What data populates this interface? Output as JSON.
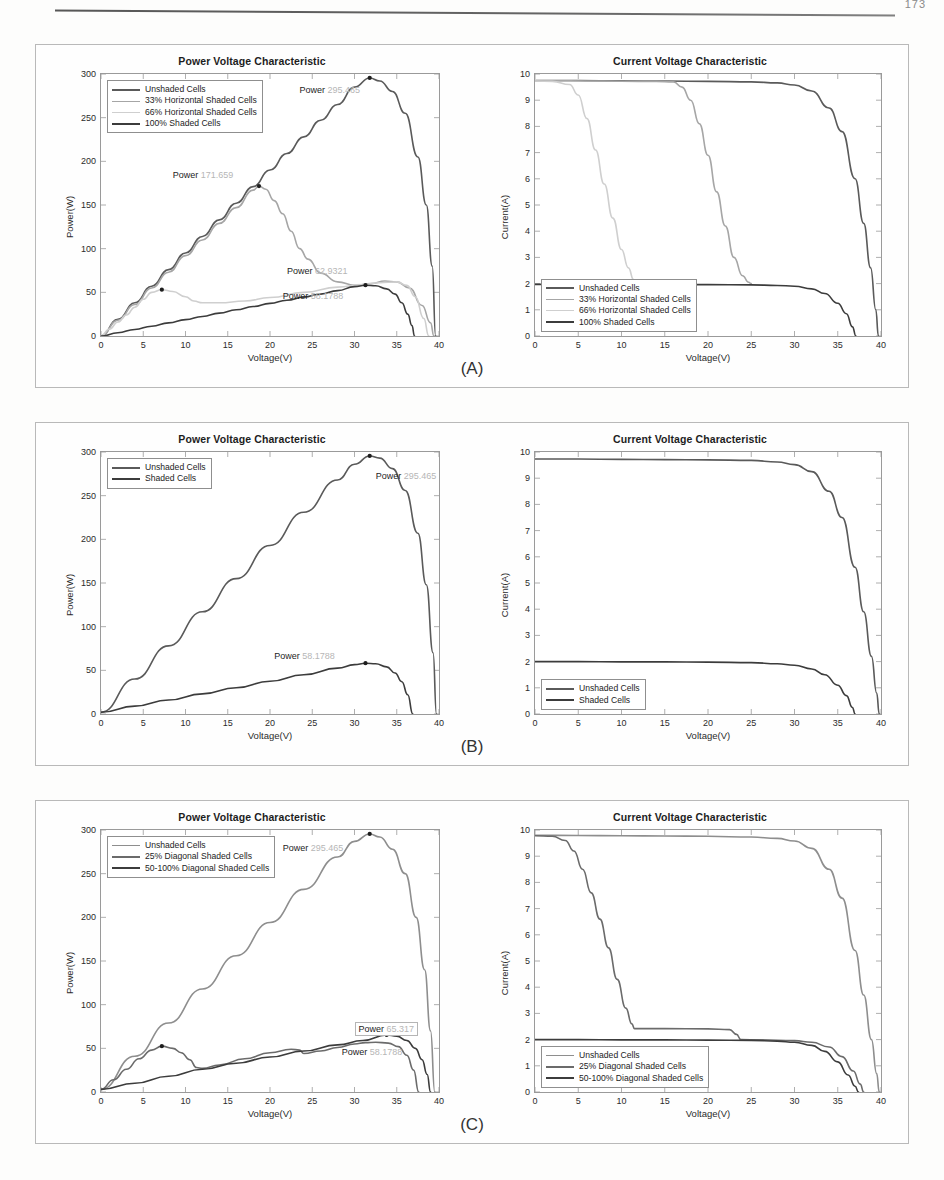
{
  "page": {
    "number": "173",
    "panel_labels": [
      "(A)",
      "(B)",
      "(C)"
    ]
  },
  "axes": {
    "power_title": "Power Voltage Characteristic",
    "current_title": "Current Voltage Characteristic",
    "xlabel": "Voltage(V)",
    "ylabel_power": "Power(W)",
    "ylabel_current": "Current(A)",
    "xticks": [
      "0",
      "5",
      "10",
      "15",
      "20",
      "25",
      "30",
      "35",
      "40"
    ],
    "yticks_power": [
      "0",
      "50",
      "100",
      "150",
      "200",
      "250",
      "300"
    ],
    "yticks_current": [
      "0",
      "1",
      "2",
      "3",
      "4",
      "5",
      "6",
      "7",
      "8",
      "9",
      "10"
    ]
  },
  "colors": {
    "unshaded": "#5a5a5a",
    "shade_a": "#9a9a9a",
    "shade_b": "#c2c2c2",
    "shade_c": "#3c3c3c",
    "axis": "#9a9a9a",
    "text": "#1d1d1d",
    "faded_value": "#b6b6b6"
  },
  "panels": [
    {
      "id": "A",
      "label": "(A)",
      "legend": [
        {
          "label": "Unshaded Cells",
          "color": "#5a5a5a",
          "width": 2.2
        },
        {
          "label": "33% Horizontal Shaded Cells",
          "color": "#a6a6a6",
          "width": 1.6
        },
        {
          "label": "66% Horizontal Shaded Cells",
          "color": "#cfcfcf",
          "width": 1.4
        },
        {
          "label": "100% Shaded Cells",
          "color": "#3c3c3c",
          "width": 2.4
        }
      ],
      "annotations": [
        {
          "prefix": "Power ",
          "value": "295.465"
        },
        {
          "prefix": "Power ",
          "value": "171.659"
        },
        {
          "prefix": "Power ",
          "value": "62.9321"
        },
        {
          "prefix": "Power ",
          "value": "58.1788"
        }
      ]
    },
    {
      "id": "B",
      "label": "(B)",
      "legend": [
        {
          "label": "Unshaded Cells",
          "color": "#5a5a5a",
          "width": 2.2
        },
        {
          "label": "Shaded Cells",
          "color": "#3c3c3c",
          "width": 2.4
        }
      ],
      "annotations": [
        {
          "prefix": "Power ",
          "value": "295.465"
        },
        {
          "prefix": "Power ",
          "value": "58.1788"
        }
      ]
    },
    {
      "id": "C",
      "label": "(C)",
      "legend": [
        {
          "label": "Unshaded Cells",
          "color": "#8e8e8e",
          "width": 1.8
        },
        {
          "label": "25% Diagonal Shaded Cells",
          "color": "#6b6b6b",
          "width": 2.0
        },
        {
          "label": "50-100% Diagonal Shaded Cells",
          "color": "#3c3c3c",
          "width": 2.4
        }
      ],
      "annotations": [
        {
          "prefix": "Power ",
          "value": "295.465"
        },
        {
          "prefix": "Power ",
          "value": "65.317"
        },
        {
          "prefix": "Power ",
          "value": "58.1788"
        }
      ]
    }
  ],
  "chart_data": [
    {
      "id": "A-power",
      "type": "line",
      "title": "Power Voltage Characteristic",
      "xlabel": "Voltage(V)",
      "ylabel": "Power(W)",
      "xlim": [
        0,
        40
      ],
      "ylim": [
        0,
        300
      ],
      "grid": false,
      "legend_position": "top-left",
      "series": [
        {
          "name": "Unshaded Cells",
          "color": "#5a5a5a",
          "peak": {
            "v": 31.8,
            "p": 295.465
          },
          "x": [
            0,
            2,
            4,
            6,
            8,
            10,
            12,
            14,
            16,
            18,
            20,
            22,
            24,
            26,
            28,
            30,
            31.8,
            33,
            34.5,
            36,
            37.5,
            38.5,
            39.2,
            39.6
          ],
          "y": [
            0,
            19,
            38,
            57,
            76,
            95,
            114,
            133,
            152,
            171,
            190,
            209,
            228,
            247,
            265,
            285,
            295.465,
            292,
            280,
            255,
            205,
            150,
            80,
            0
          ]
        },
        {
          "name": "33% Horizontal Shaded Cells",
          "color": "#a6a6a6",
          "peak": {
            "v": 18.7,
            "p": 171.659
          },
          "x": [
            0,
            2,
            4,
            6,
            8,
            10,
            12,
            14,
            16,
            18,
            18.7,
            19.5,
            20.5,
            21.5,
            22.5,
            23.5,
            24.5,
            26,
            28,
            30,
            32,
            33.6,
            35,
            36.5,
            38,
            39,
            39.4
          ],
          "y": [
            0,
            18,
            36,
            55,
            73,
            92,
            110,
            129,
            147,
            167,
            171.659,
            168,
            155,
            140,
            120,
            100,
            88,
            72,
            62,
            58,
            60,
            62.9321,
            62,
            55,
            35,
            15,
            0
          ]
        },
        {
          "name": "66% Horizontal Shaded Cells",
          "color": "#cfcfcf",
          "peak": {
            "v": 7.2,
            "p": 53.0
          },
          "x": [
            0,
            1,
            2,
            3,
            4,
            5,
            6,
            7.2,
            8.5,
            10,
            11,
            12,
            14,
            17,
            20,
            24,
            28,
            31,
            33,
            35,
            36.2,
            37.2,
            38.2,
            38.8
          ],
          "y": [
            0,
            8,
            16,
            24,
            33,
            42,
            50,
            53.0,
            51,
            45,
            40,
            38,
            38,
            40,
            44,
            50,
            56,
            59,
            61,
            62,
            58,
            45,
            20,
            0
          ]
        },
        {
          "name": "100% Shaded Cells",
          "color": "#3c3c3c",
          "peak": {
            "v": 31.3,
            "p": 58.1788
          },
          "x": [
            0,
            2,
            4,
            6,
            8,
            10,
            12,
            14,
            16,
            18,
            20,
            22,
            24,
            26,
            28,
            30,
            31.3,
            32.5,
            33.8,
            34.8,
            35.6,
            36.3,
            36.8,
            37.1
          ],
          "y": [
            0,
            3.7,
            7.5,
            11.2,
            15,
            18.7,
            22.4,
            26.2,
            30,
            33.7,
            37.4,
            41,
            44.5,
            48,
            52,
            56.5,
            58.1788,
            57.5,
            54,
            48,
            38,
            25,
            12,
            0
          ]
        }
      ]
    },
    {
      "id": "A-current",
      "type": "line",
      "title": "Current Voltage Characteristic",
      "xlabel": "Voltage(V)",
      "ylabel": "Current(A)",
      "xlim": [
        0,
        40
      ],
      "ylim": [
        0,
        10
      ],
      "grid": false,
      "legend_position": "bottom-left",
      "series": [
        {
          "name": "Unshaded Cells",
          "color": "#5a5a5a",
          "x": [
            0,
            5,
            10,
            15,
            20,
            25,
            28,
            30,
            32,
            34,
            35.5,
            37,
            38,
            38.8,
            39.4,
            39.7
          ],
          "y": [
            9.75,
            9.75,
            9.74,
            9.73,
            9.72,
            9.7,
            9.66,
            9.58,
            9.35,
            8.7,
            7.8,
            6.0,
            4.3,
            2.6,
            1.0,
            0
          ]
        },
        {
          "name": "33% Horizontal Shaded Cells",
          "color": "#a6a6a6",
          "x": [
            0,
            4,
            8,
            12,
            14,
            16,
            17,
            18,
            19,
            20,
            21,
            22,
            23,
            24,
            24.7,
            25.0
          ],
          "y": [
            9.74,
            9.74,
            9.73,
            9.72,
            9.72,
            9.7,
            9.5,
            9.0,
            8.1,
            6.9,
            5.5,
            4.2,
            3.0,
            2.3,
            2.05,
            2.0
          ]
        },
        {
          "name": "66% Horizontal Shaded Cells",
          "color": "#cfcfcf",
          "x": [
            0,
            2,
            4,
            5,
            6,
            7,
            8,
            9,
            10,
            10.8,
            11.4,
            11.8
          ],
          "y": [
            9.73,
            9.72,
            9.6,
            9.2,
            8.3,
            7.1,
            5.8,
            4.5,
            3.3,
            2.6,
            2.15,
            2.0
          ]
        },
        {
          "name": "100% Shaded Cells",
          "color": "#3c3c3c",
          "x": [
            0,
            5,
            10,
            15,
            20,
            25,
            28,
            30,
            32,
            33.5,
            35,
            36,
            36.7,
            37.1
          ],
          "y": [
            1.97,
            1.97,
            1.97,
            1.96,
            1.96,
            1.95,
            1.93,
            1.9,
            1.8,
            1.62,
            1.25,
            0.85,
            0.35,
            0
          ]
        }
      ]
    },
    {
      "id": "B-power",
      "type": "line",
      "title": "Power Voltage Characteristic",
      "xlabel": "Voltage(V)",
      "ylabel": "Power(W)",
      "xlim": [
        0,
        40
      ],
      "ylim": [
        0,
        300
      ],
      "grid": false,
      "legend_position": "top-left",
      "series": [
        {
          "name": "Unshaded Cells",
          "color": "#5a5a5a",
          "peak": {
            "v": 31.8,
            "p": 295.465
          },
          "x": [
            0,
            4,
            8,
            12,
            16,
            20,
            24,
            28,
            30,
            31.8,
            33,
            34.5,
            36,
            37.5,
            38.5,
            39.3,
            39.7
          ],
          "y": [
            2,
            40,
            78,
            117,
            155,
            193,
            231,
            268,
            286,
            295.465,
            293,
            281,
            256,
            207,
            148,
            70,
            0
          ]
        },
        {
          "name": "Shaded Cells",
          "color": "#3c3c3c",
          "peak": {
            "v": 31.3,
            "p": 58.1788
          },
          "x": [
            0,
            4,
            8,
            12,
            16,
            20,
            24,
            28,
            30,
            31.3,
            32.5,
            33.8,
            34.8,
            35.6,
            36.3,
            36.9
          ],
          "y": [
            2,
            9,
            16,
            23,
            30,
            37.5,
            45,
            52.5,
            56.5,
            58.1788,
            57.5,
            54,
            47,
            37,
            22,
            0
          ]
        }
      ]
    },
    {
      "id": "B-current",
      "type": "line",
      "title": "Current Voltage Characteristic",
      "xlabel": "Voltage(V)",
      "ylabel": "Current(A)",
      "xlim": [
        0,
        40
      ],
      "ylim": [
        0,
        10
      ],
      "grid": false,
      "legend_position": "bottom-left",
      "series": [
        {
          "name": "Unshaded Cells",
          "color": "#5a5a5a",
          "x": [
            0,
            5,
            10,
            15,
            20,
            25,
            28,
            30,
            32,
            34,
            35.5,
            37,
            38,
            38.9,
            39.5,
            39.8
          ],
          "y": [
            9.73,
            9.73,
            9.72,
            9.71,
            9.7,
            9.68,
            9.62,
            9.52,
            9.25,
            8.5,
            7.5,
            5.6,
            3.9,
            2.2,
            0.8,
            0
          ]
        },
        {
          "name": "Shaded Cells",
          "color": "#3c3c3c",
          "x": [
            0,
            5,
            10,
            15,
            20,
            25,
            28,
            30,
            32,
            33.5,
            35,
            36,
            36.7,
            37.0
          ],
          "y": [
            2.0,
            2.0,
            1.99,
            1.99,
            1.98,
            1.96,
            1.92,
            1.86,
            1.72,
            1.5,
            1.1,
            0.7,
            0.25,
            0
          ]
        }
      ]
    },
    {
      "id": "C-power",
      "type": "line",
      "title": "Power Voltage Characteristic",
      "xlabel": "Voltage(V)",
      "ylabel": "Power(W)",
      "xlim": [
        0,
        40
      ],
      "ylim": [
        0,
        300
      ],
      "grid": false,
      "legend_position": "top-left",
      "series": [
        {
          "name": "Unshaded Cells",
          "color": "#8e8e8e",
          "peak": {
            "v": 31.8,
            "p": 295.465
          },
          "x": [
            0,
            4,
            8,
            12,
            16,
            20,
            24,
            28,
            30,
            31.8,
            33,
            34.5,
            36,
            37.3,
            38.3,
            39.0,
            39.5
          ],
          "y": [
            3,
            41,
            79,
            118,
            156,
            194,
            232,
            269,
            287,
            295.465,
            292,
            278,
            250,
            200,
            140,
            70,
            0
          ]
        },
        {
          "name": "25% Diagonal Shaded Cells",
          "color": "#6b6b6b",
          "peak": {
            "v": 7.2,
            "p": 52.5
          },
          "x": [
            0,
            1.5,
            3,
            4.5,
            6,
            7.2,
            8.5,
            9.5,
            10.5,
            11.3,
            12,
            14,
            17,
            20,
            22.5,
            23.5,
            24,
            26,
            28,
            30,
            31.3,
            32.5,
            34,
            35.2,
            36.2,
            37.0,
            37.6
          ],
          "y": [
            3,
            14,
            26,
            38,
            48,
            52.5,
            50,
            45,
            37,
            28,
            27,
            31,
            38,
            45,
            49,
            48,
            44,
            47,
            51,
            55,
            56.5,
            57,
            56,
            52,
            42,
            25,
            0
          ]
        },
        {
          "name": "50-100% Diagonal Shaded Cells",
          "color": "#3c3c3c",
          "peak": {
            "v": 33.8,
            "p": 65.317
          },
          "x": [
            0,
            4,
            8,
            12,
            16,
            20,
            24,
            28,
            31,
            33.8,
            35,
            36.2,
            37.2,
            38.0,
            38.6,
            39.0
          ],
          "y": [
            3,
            10,
            18,
            26,
            33,
            40,
            47,
            54,
            59,
            65.317,
            64,
            59,
            50,
            37,
            20,
            0
          ]
        }
      ]
    },
    {
      "id": "C-current",
      "type": "line",
      "title": "Current Voltage Characteristic",
      "xlabel": "Voltage(V)",
      "ylabel": "Current(A)",
      "xlim": [
        0,
        40
      ],
      "ylim": [
        0,
        10
      ],
      "grid": false,
      "legend_position": "bottom-left",
      "series": [
        {
          "name": "Unshaded Cells",
          "color": "#8e8e8e",
          "x": [
            0,
            5,
            10,
            15,
            20,
            25,
            28,
            30,
            32,
            34,
            35.5,
            37,
            38,
            38.9,
            39.5,
            39.8
          ],
          "y": [
            9.8,
            9.79,
            9.78,
            9.77,
            9.76,
            9.73,
            9.68,
            9.58,
            9.3,
            8.5,
            7.4,
            5.4,
            3.7,
            2.0,
            0.7,
            0
          ]
        },
        {
          "name": "25% Diagonal Shaded Cells",
          "color": "#6b6b6b",
          "x": [
            0,
            2,
            3.5,
            4.5,
            5.5,
            6.5,
            7.5,
            8.5,
            9.5,
            10.5,
            11.2,
            11.5,
            15,
            20,
            22.5,
            23.3,
            23.8,
            26,
            30,
            32,
            34,
            35.5,
            36.8,
            37.6,
            38.0
          ],
          "y": [
            9.78,
            9.76,
            9.6,
            9.2,
            8.5,
            7.6,
            6.6,
            5.5,
            4.3,
            3.2,
            2.6,
            2.42,
            2.42,
            2.41,
            2.38,
            2.2,
            2.0,
            1.99,
            1.96,
            1.9,
            1.72,
            1.35,
            0.8,
            0.3,
            0
          ]
        },
        {
          "name": "50-100% Diagonal Shaded Cells",
          "color": "#3c3c3c",
          "x": [
            0,
            5,
            10,
            15,
            20,
            25,
            28,
            30,
            32,
            33.5,
            35,
            36.2,
            37.0,
            37.4
          ],
          "y": [
            2.0,
            2.0,
            1.99,
            1.99,
            1.98,
            1.97,
            1.94,
            1.9,
            1.78,
            1.55,
            1.15,
            0.65,
            0.22,
            0
          ]
        }
      ]
    }
  ]
}
